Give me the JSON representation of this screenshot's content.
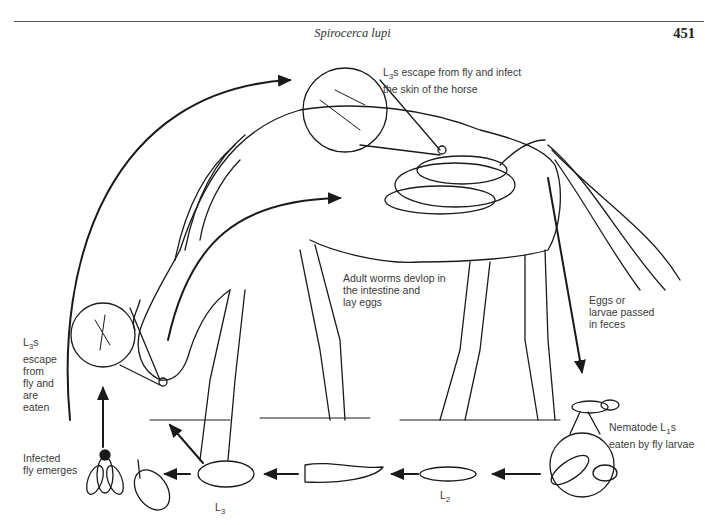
{
  "header": {
    "running_title": "Spirocerca lupi",
    "page_number": "451"
  },
  "diagram": {
    "labels": {
      "skin_infection": {
        "prefix": "L",
        "sub": "3",
        "text": "s escape from fly and infect\n the skin of the horse"
      },
      "adult_worms": "Adult worms devlop in\nthe intestine and\nlay eggs",
      "eggs_passed": "Eggs or\nlarvae passed\nin feces",
      "nematode_l1": {
        "prefix": "Nematode L",
        "sub": "1",
        "text": "s\neaten by fly larvae"
      },
      "escape_eaten": {
        "prefix": "L",
        "sub": "3",
        "text": "s\nescape\nfrom\nfly and\nare\neaten"
      },
      "fly_emerges": "Infected\nfly emerges",
      "stage_l2": {
        "prefix": "L",
        "sub": "2"
      },
      "stage_l3": {
        "prefix": "L",
        "sub": "3"
      }
    },
    "cycle_order": [
      "Adult worms in intestine",
      "Eggs or larvae passed in feces",
      "Nematode L1s eaten by fly larvae",
      "L2",
      "L3",
      "Pupa",
      "Infected fly emerges",
      "L3s escape from fly and are eaten / infect skin"
    ]
  }
}
